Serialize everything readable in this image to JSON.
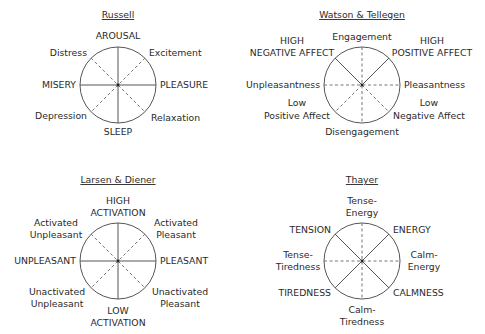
{
  "diagrams": [
    {
      "title": "Russell",
      "labels": {
        "top": "AROUSAL",
        "top_left": "Distress",
        "top_right": "Excitement",
        "left": "MISERY",
        "right": "PLEASURE",
        "bottom_left": "Depression",
        "bottom_right": "Relaxation",
        "bottom": "SLEEP"
      },
      "solid_axes": [
        "vertical",
        "horizontal"
      ],
      "dashed_axes": [
        "diagonal-ne-sw",
        "diagonal-nw-se"
      ]
    },
    {
      "title": "Watson & Tellegen",
      "labels": {
        "top": "Engagement",
        "top_left_1": "HIGH",
        "top_left_2": "NEGATIVE AFFECT",
        "top_right_1": "HIGH",
        "top_right_2": "POSITIVE AFFECT",
        "left": "Unpleasantness",
        "right": "Pleasantness",
        "bottom_left_1": "Low",
        "bottom_left_2": "Positive Affect",
        "bottom_right_1": "Low",
        "bottom_right_2": "Negative Affect",
        "bottom": "Disengagement"
      },
      "solid_axes": [
        "upper-left-radius",
        "upper-right-radius"
      ],
      "dashed_axes": [
        "vertical",
        "horizontal",
        "lower-left-radius",
        "lower-right-radius"
      ]
    },
    {
      "title": "Larsen & Diener",
      "labels": {
        "top_1": "HIGH",
        "top_2": "ACTIVATION",
        "top_left_1": "Activated",
        "top_left_2": "Unpleasant",
        "top_right_1": "Activated",
        "top_right_2": "Pleasant",
        "left": "UNPLEASANT",
        "right": "PLEASANT",
        "bottom_left_1": "Unactivated",
        "bottom_left_2": "Unpleasant",
        "bottom_right_1": "Unactivated",
        "bottom_right_2": "Pleasant",
        "bottom_1": "LOW",
        "bottom_2": "ACTIVATION"
      },
      "solid_axes": [
        "vertical",
        "horizontal"
      ],
      "dashed_axes": [
        "diagonal-ne-sw",
        "diagonal-nw-se"
      ]
    },
    {
      "title": "Thayer",
      "labels": {
        "top_1": "Tense-",
        "top_2": "Energy",
        "top_left": "TENSION",
        "top_right": "ENERGY",
        "left_1": "Tense-",
        "left_2": "Tiredness",
        "right_1": "Calm-",
        "right_2": "Energy",
        "bottom_left": "TIREDNESS",
        "bottom_right": "CALMNESS",
        "bottom_1": "Calm-",
        "bottom_2": "Tiredness"
      },
      "solid_axes": [
        "diagonal-ne-sw",
        "diagonal-nw-se"
      ],
      "dashed_axes": [
        "vertical",
        "horizontal"
      ]
    }
  ]
}
